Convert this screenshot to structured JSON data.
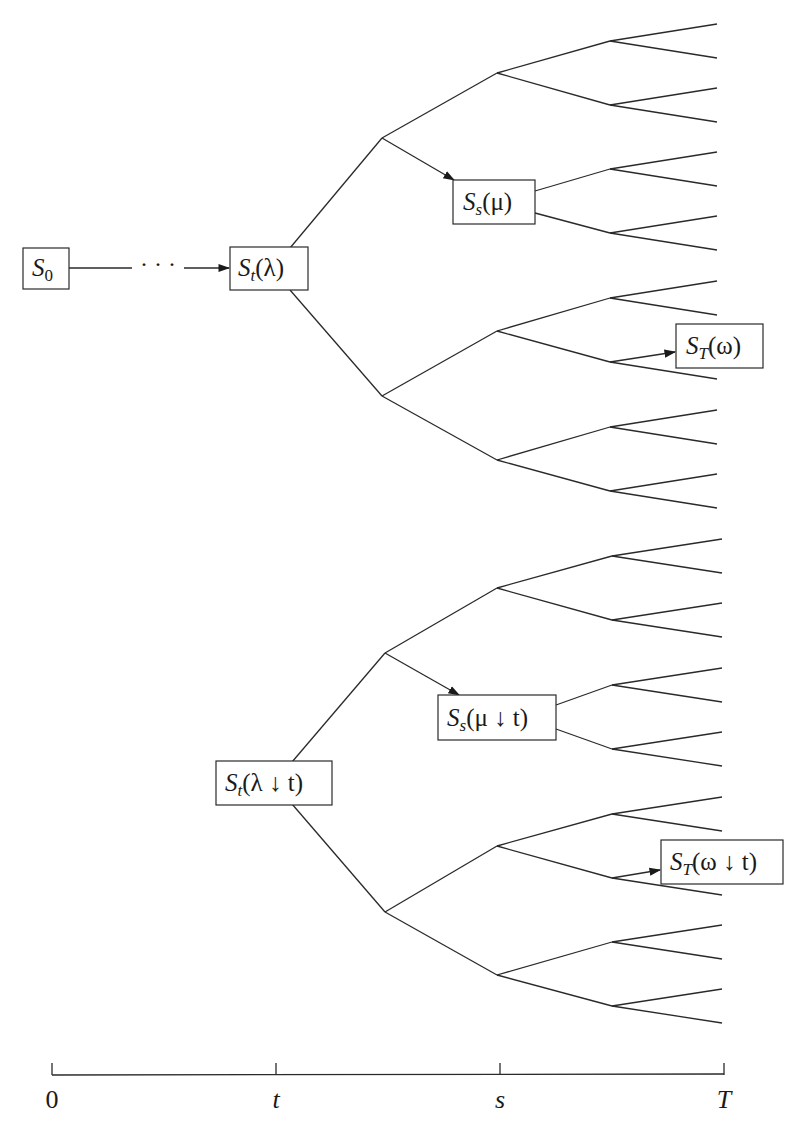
{
  "diagram": {
    "nodes": {
      "s0": {
        "base": "S",
        "sub": "0",
        "arg": ""
      },
      "st_lambda": {
        "base": "S",
        "sub": "t",
        "arg": "(λ)"
      },
      "ss_mu": {
        "base": "S",
        "sub": "s",
        "arg": "(μ)"
      },
      "sT_omega": {
        "base": "S",
        "sub": "T",
        "arg": "(ω)"
      },
      "st_lambda_t": {
        "base": "S",
        "sub": "t",
        "arg": "(λ ↓ t)"
      },
      "ss_mu_t": {
        "base": "S",
        "sub": "s",
        "arg": "(μ ↓ t)"
      },
      "sT_omega_t": {
        "base": "S",
        "sub": "T",
        "arg": "(ω ↓ t)"
      }
    },
    "ellipsis": "· · ·",
    "time_axis": {
      "ticks": [
        {
          "label": "0",
          "x": 52
        },
        {
          "label": "t",
          "x": 276
        },
        {
          "label": "s",
          "x": 500
        },
        {
          "label": "T",
          "x": 724
        }
      ]
    },
    "trees": [
      {
        "name": "top-tree",
        "root": {
          "x": 290,
          "y": 268,
          "yTop": 248,
          "yBot": 290
        },
        "level1": [
          {
            "x": 382,
            "y": 138
          },
          {
            "x": 382,
            "y": 396
          }
        ],
        "level2": [
          {
            "x": 497,
            "y": 73
          },
          {
            "x": 497,
            "y": 203
          },
          {
            "x": 497,
            "y": 331
          },
          {
            "x": 497,
            "y": 460
          }
        ],
        "level3": [
          {
            "x": 610,
            "y": 41
          },
          {
            "x": 610,
            "y": 105
          },
          {
            "x": 610,
            "y": 169
          },
          {
            "x": 610,
            "y": 233
          },
          {
            "x": 610,
            "y": 298
          },
          {
            "x": 610,
            "y": 362
          },
          {
            "x": 610,
            "y": 427
          },
          {
            "x": 610,
            "y": 491
          }
        ],
        "leaf_x": 717,
        "leaf_spread": 17
      },
      {
        "name": "bottom-tree",
        "root": {
          "x": 292,
          "y": 782,
          "yTop": 762,
          "yBot": 804
        },
        "level1": [
          {
            "x": 385,
            "y": 653
          },
          {
            "x": 385,
            "y": 912
          }
        ],
        "level2": [
          {
            "x": 497,
            "y": 588
          },
          {
            "x": 497,
            "y": 717
          },
          {
            "x": 497,
            "y": 846
          },
          {
            "x": 497,
            "y": 975
          }
        ],
        "level3": [
          {
            "x": 612,
            "y": 556
          },
          {
            "x": 612,
            "y": 620
          },
          {
            "x": 612,
            "y": 685
          },
          {
            "x": 612,
            "y": 749
          },
          {
            "x": 612,
            "y": 814
          },
          {
            "x": 612,
            "y": 878
          },
          {
            "x": 612,
            "y": 942
          },
          {
            "x": 612,
            "y": 1006
          }
        ],
        "leaf_x": 722,
        "leaf_spread": 17
      }
    ]
  }
}
